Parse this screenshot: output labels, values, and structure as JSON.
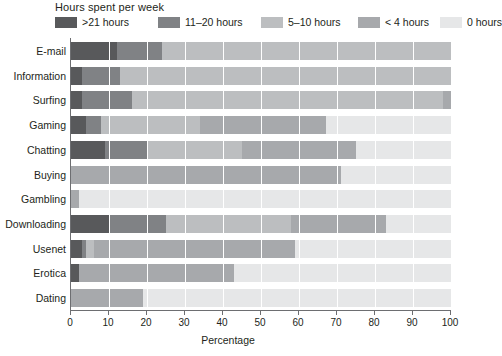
{
  "legend": {
    "title": "Hours spent per week",
    "entries": [
      {
        "label": ">21 hours",
        "color": "#58595b",
        "x": 0
      },
      {
        "label": "11–20 hours",
        "color": "#808285",
        "x": 103
      },
      {
        "label": "5–10 hours",
        "color": "#bcbec0",
        "x": 206
      },
      {
        "label": "< 4 hours",
        "color": "#a7a9ac",
        "x": 303
      },
      {
        "label": "0 hours",
        "color": "#e6e7e8",
        "x": 385
      }
    ]
  },
  "axis": {
    "title": "Percentage",
    "ticks": [
      0,
      10,
      20,
      30,
      40,
      50,
      60,
      70,
      80,
      90,
      100
    ],
    "min": 0,
    "max": 100
  },
  "chart_data": {
    "type": "bar",
    "orientation": "horizontal",
    "stacked": true,
    "stack_total": 100,
    "title": "",
    "subtitle": "",
    "xlabel": "Percentage",
    "ylabel": "",
    "xlim": [
      0,
      100
    ],
    "grid": true,
    "grid_axis": "x",
    "legend_title": "Hours spent per week",
    "legend_position": "top",
    "categories": [
      "E-mail",
      "Information",
      "Surfing",
      "Gaming",
      "Chatting",
      "Buying",
      "Gambling",
      "Downloading",
      "Usenet",
      "Erotica",
      "Dating"
    ],
    "series": [
      {
        "name": ">21 hours",
        "color": "#58595b",
        "values": [
          12,
          3,
          3,
          4,
          9,
          0,
          0,
          10,
          3,
          2,
          0
        ]
      },
      {
        "name": "11–20 hours",
        "color": "#808285",
        "values": [
          12,
          10,
          13,
          4,
          11,
          0,
          0,
          15,
          1,
          0,
          0
        ]
      },
      {
        "name": "5–10 hours",
        "color": "#bcbec0",
        "values": [
          76,
          87,
          82,
          26,
          25,
          0,
          0,
          33,
          2,
          0,
          0
        ]
      },
      {
        "name": "< 4 hours",
        "color": "#a7a9ac",
        "values": [
          0,
          0,
          2,
          33,
          30,
          71,
          2,
          25,
          53,
          41,
          19
        ]
      },
      {
        "name": "0 hours",
        "color": "#e6e7e8",
        "values": [
          0,
          0,
          0,
          33,
          25,
          29,
          98,
          17,
          41,
          57,
          81
        ]
      }
    ]
  }
}
